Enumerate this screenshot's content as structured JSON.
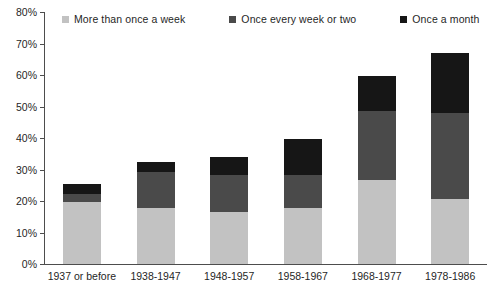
{
  "chart_data": {
    "type": "bar",
    "subtype": "stacked-bar",
    "title": "",
    "subtitle": "",
    "xlabel": "",
    "ylabel": "",
    "ylim": [
      0,
      80
    ],
    "ytick_labels": [
      "0%",
      "10%",
      "20%",
      "30%",
      "40%",
      "50%",
      "60%",
      "70%",
      "80%"
    ],
    "ytick_values": [
      0,
      10,
      20,
      30,
      40,
      50,
      60,
      70,
      80
    ],
    "grid": false,
    "legend_position": "top",
    "categories": [
      "1937 or before",
      "1938-1947",
      "1948-1957",
      "1958-1967",
      "1968-1977",
      "1978-1986"
    ],
    "series": [
      {
        "name": "More than once a week",
        "color": "#c2c2c2",
        "values": [
          19.6,
          17.7,
          16.4,
          17.7,
          26.6,
          20.6
        ]
      },
      {
        "name": "Once every week or two",
        "color": "#4a4a4a",
        "values": [
          2.6,
          11.4,
          11.8,
          10.5,
          21.9,
          27.4
        ]
      },
      {
        "name": "Once a month",
        "color": "#161616",
        "values": [
          3.1,
          3.2,
          5.7,
          11.4,
          11.3,
          19.0
        ]
      }
    ],
    "totals": [
      25.3,
      32.3,
      33.9,
      39.6,
      59.8,
      67.0
    ]
  },
  "legend": {
    "entries": [
      {
        "label": "More than once a week",
        "color": "#c2c2c2"
      },
      {
        "label": "Once every week or two",
        "color": "#4a4a4a"
      },
      {
        "label": "Once a month",
        "color": "#161616"
      }
    ]
  },
  "colors": {
    "axis": "#4d4d4d",
    "text": "#1f1f1f",
    "background": "#ffffff",
    "series_light": "#c2c2c2",
    "series_mid": "#4a4a4a",
    "series_dark": "#161616"
  }
}
